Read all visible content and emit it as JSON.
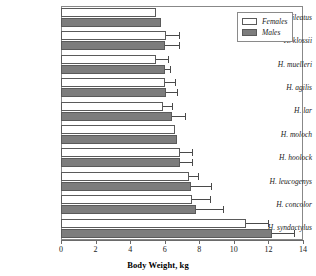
{
  "chart_data": {
    "type": "bar",
    "orientation": "horizontal",
    "title": "",
    "xlabel": "Body Weight, kg",
    "ylabel": "",
    "xlim": [
      0,
      14
    ],
    "xticks": [
      0,
      2,
      4,
      6,
      8,
      10,
      12,
      14
    ],
    "xticklabels": [
      "0",
      "2",
      "4",
      "6",
      "8",
      "10",
      "12",
      "14"
    ],
    "grid": false,
    "legend_position": "top-right",
    "categories": [
      "H. pileatus",
      "H. klossii",
      "H. muelleri",
      "H. agilis",
      "H. lar",
      "H. moloch",
      "H. hoolock",
      "H. leucogenys",
      "H. concolor",
      "H. syndactylus"
    ],
    "series": [
      {
        "name": "Females",
        "color": "#ffffff",
        "values": [
          5.5,
          6.1,
          5.5,
          6.0,
          5.9,
          6.6,
          6.9,
          7.4,
          7.6,
          10.7
        ],
        "errors_upper": [
          0.0,
          6.8,
          6.2,
          6.6,
          6.4,
          0.0,
          7.6,
          7.9,
          8.6,
          12.0
        ]
      },
      {
        "name": "Males",
        "color": "#7d7d7d",
        "values": [
          5.8,
          6.0,
          6.0,
          6.1,
          6.4,
          6.7,
          6.9,
          7.5,
          7.8,
          12.2
        ],
        "errors_upper": [
          0.0,
          6.8,
          6.3,
          6.7,
          7.2,
          0.0,
          7.6,
          8.7,
          9.4,
          13.5
        ]
      }
    ]
  },
  "legend": {
    "entries": [
      {
        "label": "Females",
        "swatch": "open-white-rectangle"
      },
      {
        "label": "Males",
        "swatch": "filled-gray-rectangle"
      }
    ]
  },
  "axis": {
    "x_title": "Body Weight, kg"
  }
}
